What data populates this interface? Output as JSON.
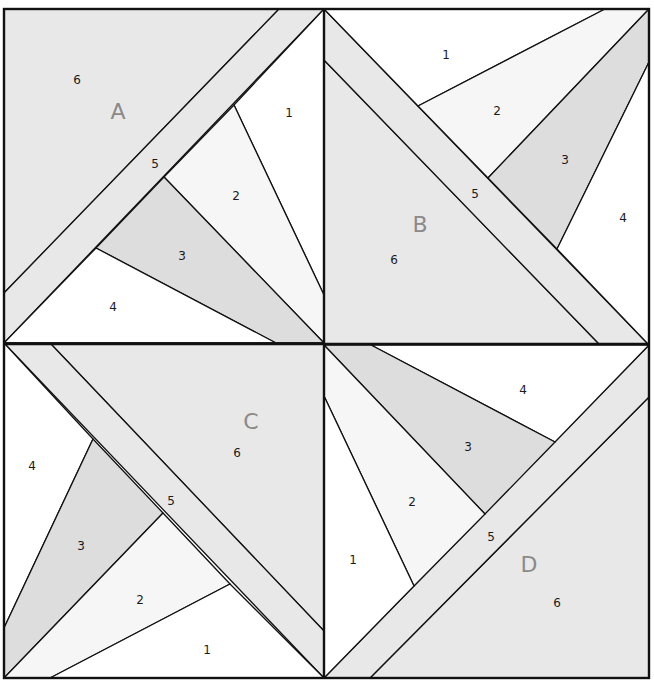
{
  "colors": {
    "white": "#ffffff",
    "light": "#f6f6f6",
    "mid": "#dddddd",
    "shade": "#e8e8e8",
    "line": "#111111",
    "letter": "#8a8a8a"
  },
  "blocks": [
    {
      "letter": "A",
      "letter_pos": [
        118,
        113
      ],
      "pieces": [
        {
          "n": "1",
          "pos": [
            289,
            113
          ],
          "fill": "white"
        },
        {
          "n": "2",
          "pos": [
            236,
            196
          ],
          "fill": "light"
        },
        {
          "n": "3",
          "pos": [
            182,
            256
          ],
          "fill": "mid"
        },
        {
          "n": "4",
          "pos": [
            113,
            307
          ],
          "fill": "white"
        },
        {
          "n": "5",
          "pos": [
            155,
            164
          ],
          "fill": "shade"
        },
        {
          "n": "6",
          "pos": [
            77,
            80
          ],
          "fill": "shade"
        }
      ]
    },
    {
      "letter": "B",
      "letter_pos": [
        420,
        226
      ],
      "pieces": [
        {
          "n": "1",
          "pos": [
            446,
            55
          ],
          "fill": "white"
        },
        {
          "n": "2",
          "pos": [
            497,
            111
          ],
          "fill": "light"
        },
        {
          "n": "3",
          "pos": [
            565,
            160
          ],
          "fill": "mid"
        },
        {
          "n": "4",
          "pos": [
            623,
            218
          ],
          "fill": "white"
        },
        {
          "n": "5",
          "pos": [
            475,
            194
          ],
          "fill": "shade"
        },
        {
          "n": "6",
          "pos": [
            394,
            260
          ],
          "fill": "shade"
        }
      ]
    },
    {
      "letter": "C",
      "letter_pos": [
        251,
        423
      ],
      "pieces": [
        {
          "n": "1",
          "pos": [
            207,
            650
          ],
          "fill": "white"
        },
        {
          "n": "2",
          "pos": [
            140,
            600
          ],
          "fill": "light"
        },
        {
          "n": "3",
          "pos": [
            81,
            546
          ],
          "fill": "mid"
        },
        {
          "n": "4",
          "pos": [
            32,
            466
          ],
          "fill": "white"
        },
        {
          "n": "5",
          "pos": [
            171,
            501
          ],
          "fill": "shade"
        },
        {
          "n": "6",
          "pos": [
            237,
            453
          ],
          "fill": "shade"
        }
      ]
    },
    {
      "letter": "D",
      "letter_pos": [
        529,
        566
      ],
      "pieces": [
        {
          "n": "1",
          "pos": [
            353,
            560
          ],
          "fill": "white"
        },
        {
          "n": "2",
          "pos": [
            412,
            502
          ],
          "fill": "light"
        },
        {
          "n": "3",
          "pos": [
            468,
            447
          ],
          "fill": "mid"
        },
        {
          "n": "4",
          "pos": [
            523,
            390
          ],
          "fill": "white"
        },
        {
          "n": "5",
          "pos": [
            491,
            537
          ],
          "fill": "shade"
        },
        {
          "n": "6",
          "pos": [
            557,
            603
          ],
          "fill": "shade"
        }
      ]
    }
  ]
}
